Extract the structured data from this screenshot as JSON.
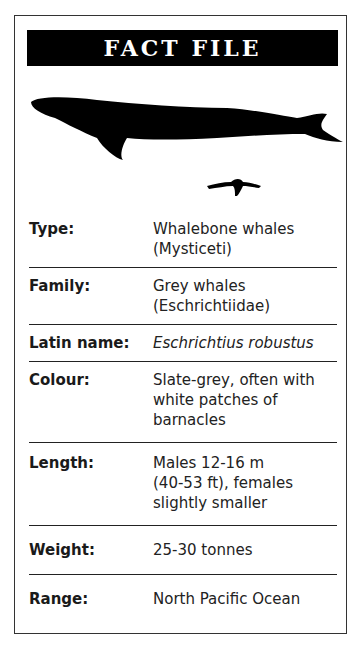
{
  "header": {
    "title": "FACT FILE"
  },
  "illustration": {
    "whale_icon": "grey-whale-silhouette",
    "diver_icon": "human-diver-silhouette"
  },
  "facts": [
    {
      "label": "Type:",
      "value": "Whalebone whales\n(Mysticeti)",
      "italic": false
    },
    {
      "label": "Family:",
      "value": "Grey whales\n(Eschrichtiidae)",
      "italic": false
    },
    {
      "label": "Latin name:",
      "value": "Eschrichtius robustus",
      "italic": true
    },
    {
      "label": "Colour:",
      "value": "Slate-grey, often with\nwhite patches of\nbarnacles",
      "italic": false
    },
    {
      "label": "Length:",
      "value": "Males 12-16 m\n(40-53 ft), females\nslightly smaller",
      "italic": false
    },
    {
      "label": "Weight:",
      "value": "25-30 tonnes",
      "italic": false
    },
    {
      "label": "Range:",
      "value": "North Pacific Ocean",
      "italic": false
    }
  ]
}
